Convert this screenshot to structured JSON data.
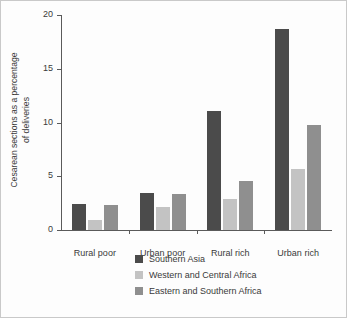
{
  "chart_data": {
    "type": "bar",
    "title": "",
    "xlabel": "",
    "ylabel": "Cesarean sections as a percentage of deliveries",
    "ylabel_lines": [
      "Cesarean sections as a percentage",
      "of deliveries"
    ],
    "categories": [
      "Rural poor",
      "Urban poor",
      "Rural rich",
      "Urban rich"
    ],
    "series": [
      {
        "name": "Southern Asia",
        "color": "#4b4b4b",
        "values": [
          2.4,
          3.4,
          11.1,
          18.7
        ]
      },
      {
        "name": "Western and Central Africa",
        "color": "#c3c3c3",
        "values": [
          0.9,
          2.1,
          2.9,
          5.7
        ]
      },
      {
        "name": "Eastern and Southern Africa",
        "color": "#8f8f8f",
        "values": [
          2.3,
          3.35,
          4.6,
          9.8
        ]
      }
    ],
    "ylim": [
      0,
      20
    ],
    "yticks": [
      0,
      5,
      10,
      15,
      20
    ],
    "ytick_labels": [
      "0",
      "5",
      "10",
      "15",
      "20"
    ],
    "grid": false,
    "legend_position": "bottom-center"
  }
}
